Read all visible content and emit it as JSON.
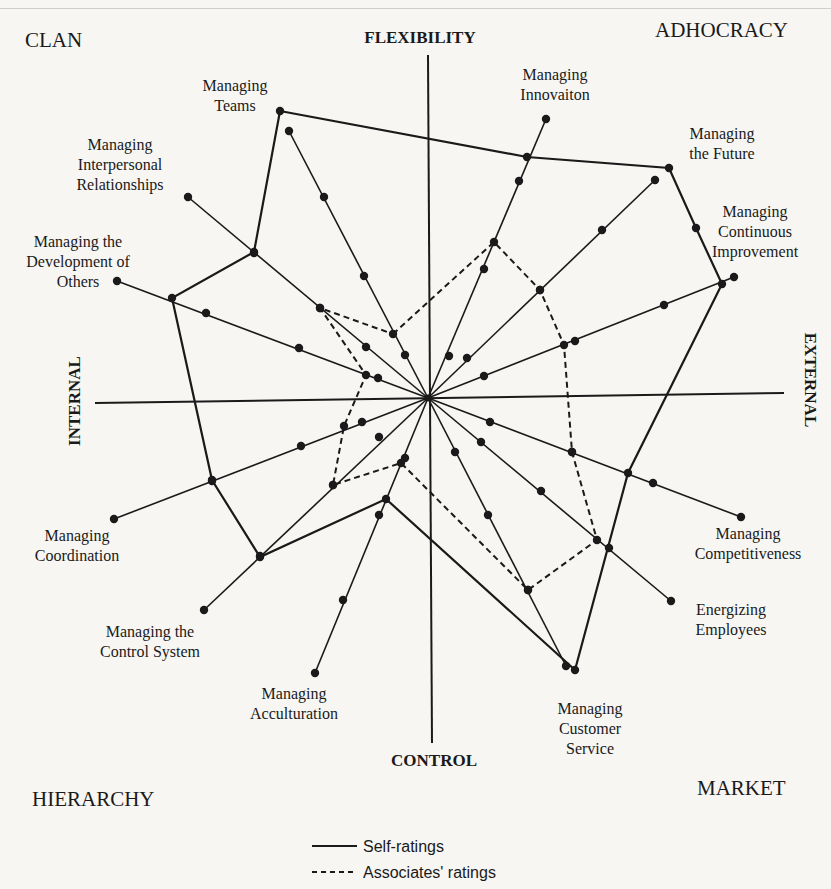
{
  "quadrants": {
    "top_left": "CLAN",
    "top_right": "ADHOCRACY",
    "bottom_left": "HIERARCHY",
    "bottom_right": "MARKET"
  },
  "axes": {
    "top": "FLEXIBILITY",
    "bottom": "CONTROL",
    "left": "INTERNAL",
    "right": "EXTERNAL"
  },
  "legend": {
    "self": "Self-ratings",
    "associates": "Associates' ratings"
  },
  "chart_data": {
    "type": "radar",
    "title": "",
    "center": [
      428,
      398
    ],
    "categories": [
      "Managing Teams",
      "Managing Innovaiton",
      "Managing the Future",
      "Managing Continuous Improvement",
      "Managing Competitiveness",
      "Energizing Employees",
      "Managing Customer Service",
      "Managing Acculturation",
      "Managing the Control System",
      "Managing Coordination",
      "Managing the Development of Others",
      "Managing Interpersonal Relationships"
    ],
    "spoke_ends": [
      [
        289,
        131
      ],
      [
        546,
        119
      ],
      [
        655,
        180
      ],
      [
        734,
        277
      ],
      [
        741,
        517
      ],
      [
        671,
        601
      ],
      [
        566,
        666
      ],
      [
        315,
        673
      ],
      [
        204,
        610
      ],
      [
        114,
        519
      ],
      [
        117,
        281
      ],
      [
        188,
        197
      ]
    ],
    "spoke_dots": [
      [
        [
          289,
          131
        ],
        [
          324,
          197
        ],
        [
          364,
          276
        ],
        [
          405,
          355
        ]
      ],
      [
        [
          546,
          119
        ],
        [
          519,
          181
        ],
        [
          484,
          269
        ],
        [
          449,
          356
        ]
      ],
      [
        [
          655,
          180
        ],
        [
          602,
          230
        ],
        [
          540,
          290
        ],
        [
          467,
          358
        ]
      ],
      [
        [
          734,
          277
        ],
        [
          664,
          305
        ],
        [
          575,
          341
        ],
        [
          484,
          376
        ]
      ],
      [
        [
          741,
          517
        ],
        [
          653,
          483
        ],
        [
          572,
          452
        ],
        [
          490,
          422
        ]
      ],
      [
        [
          671,
          601
        ],
        [
          609,
          548
        ],
        [
          541,
          491
        ],
        [
          481,
          442
        ]
      ],
      [
        [
          566,
          666
        ],
        [
          528,
          590
        ],
        [
          488,
          515
        ],
        [
          455,
          452
        ]
      ],
      [
        [
          315,
          673
        ],
        [
          343,
          600
        ],
        [
          379,
          515
        ],
        [
          405,
          458
        ]
      ],
      [
        [
          204,
          610
        ],
        [
          260,
          556
        ],
        [
          333,
          485
        ],
        [
          379,
          437
        ]
      ],
      [
        [
          114,
          519
        ],
        [
          212,
          481
        ],
        [
          301,
          446
        ],
        [
          362,
          422
        ]
      ],
      [
        [
          117,
          281
        ],
        [
          206,
          313
        ],
        [
          299,
          348
        ],
        [
          378,
          378
        ]
      ],
      [
        [
          188,
          197
        ],
        [
          254,
          253
        ],
        [
          320,
          308
        ],
        [
          366,
          347
        ]
      ]
    ],
    "series": [
      {
        "name": "Self-ratings",
        "style": "solid",
        "points": [
          [
            280,
            111
          ],
          [
            527,
            157
          ],
          [
            669,
            168
          ],
          [
            696,
            228
          ],
          [
            722,
            284
          ],
          [
            628,
            473
          ],
          [
            575,
            670
          ],
          [
            386,
            499
          ],
          [
            260,
            557
          ],
          [
            212,
            480
          ],
          [
            172,
            298
          ],
          [
            254,
            252
          ]
        ]
      },
      {
        "name": "Associates' ratings",
        "style": "dashed",
        "points": [
          [
            393,
            334
          ],
          [
            494,
            242
          ],
          [
            540,
            290
          ],
          [
            564,
            345
          ],
          [
            572,
            452
          ],
          [
            597,
            540
          ],
          [
            528,
            590
          ],
          [
            401,
            463
          ],
          [
            333,
            485
          ],
          [
            344,
            426
          ],
          [
            366,
            375
          ],
          [
            320,
            308
          ]
        ]
      }
    ],
    "xlabel": "",
    "ylabel": "",
    "grid": false,
    "legend_position": "bottom-center"
  }
}
